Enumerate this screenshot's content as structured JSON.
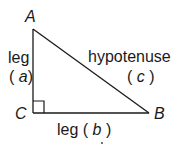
{
  "diagram": {
    "vertices": {
      "A": "A",
      "B": "B",
      "C": "C"
    },
    "labels": {
      "leg_a_word": "leg",
      "leg_a_var": "(a)",
      "leg_a_open": "(",
      "leg_a_letter": "a",
      "leg_a_close": ")",
      "hyp_word": "hypotenuse",
      "hyp_open": "(",
      "hyp_letter": "c",
      "hyp_close": ")",
      "leg_b_word": "leg",
      "leg_b_open": "(",
      "leg_b_letter": "b",
      "leg_b_close": ")"
    },
    "line_color": "#1a1a1a"
  }
}
